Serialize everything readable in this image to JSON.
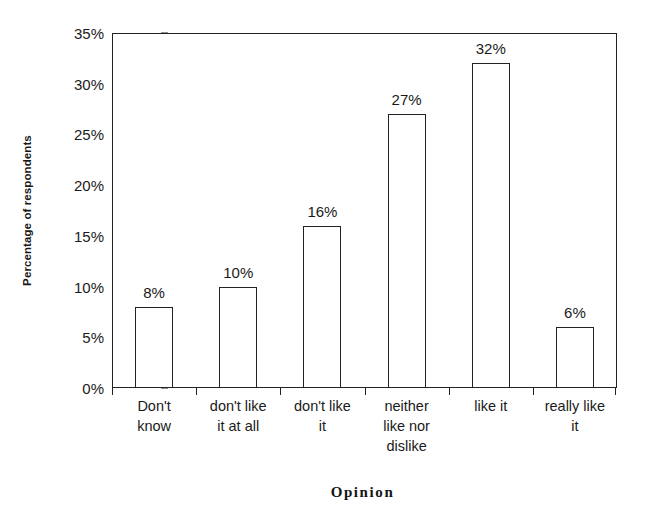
{
  "chart_data": {
    "type": "bar",
    "title": "",
    "xlabel": "Opinion",
    "ylabel": "Percentage of respondents",
    "categories": [
      "Don't know",
      "don't like it at all",
      "don't like it",
      "neither like nor dislike",
      "like it",
      "really like it"
    ],
    "category_lines": [
      [
        "Don't",
        "know"
      ],
      [
        "don't like",
        "it at all"
      ],
      [
        "don't like",
        "it"
      ],
      [
        "neither",
        "like nor",
        "dislike"
      ],
      [
        "like it"
      ],
      [
        "really like",
        "it"
      ]
    ],
    "values": [
      8,
      10,
      16,
      27,
      32,
      6
    ],
    "value_labels": [
      "8%",
      "10%",
      "16%",
      "27%",
      "32%",
      "6%"
    ],
    "ylim": [
      0,
      35
    ],
    "ytick_values": [
      0,
      5,
      10,
      15,
      20,
      25,
      30,
      35
    ],
    "ytick_labels": [
      "0%",
      "5%",
      "10%",
      "15%",
      "20%",
      "25%",
      "30%",
      "35%"
    ],
    "grid": false,
    "legend": false,
    "bar_fill_color": "#ffffff",
    "bar_border_color": "#222222",
    "axis_color": "#222222",
    "background_color": "#ffffff"
  }
}
